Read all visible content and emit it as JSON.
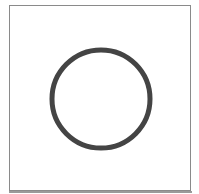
{
  "figure": {
    "shape": "circle-outline",
    "center": [
      101,
      99
    ],
    "radius": 49,
    "stroke_width": 5,
    "colors": {
      "stroke": "#444444",
      "fill": "none",
      "frame_border": "#8a8a8a",
      "background": "#ffffff"
    }
  }
}
